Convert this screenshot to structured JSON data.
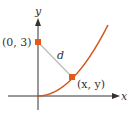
{
  "diagram": {
    "axes": {
      "x_label": "x",
      "y_label": "y",
      "axis_color": "#333333"
    },
    "curve": {
      "color": "#d2571c",
      "description": "increasing curve from origin"
    },
    "points": [
      {
        "label": "(0, 3)",
        "color": "#e05a1a"
      },
      {
        "label": "(x, y)",
        "color": "#e05a1a"
      }
    ],
    "segment": {
      "label": "d",
      "color": "#bbbbbb"
    }
  }
}
